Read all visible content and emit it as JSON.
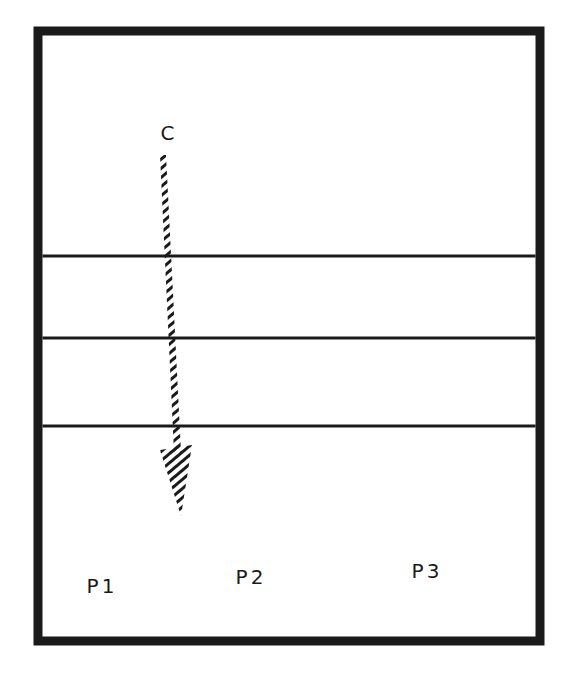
{
  "diagram": {
    "colors": {
      "stroke": "#1a1a1a",
      "background": "#ffffff"
    },
    "frame": {
      "x": 38,
      "y": 31,
      "width": 502,
      "height": 610,
      "stroke_width": 9
    },
    "layers": [
      {
        "y": 256,
        "stroke_width": 3
      },
      {
        "y": 338,
        "stroke_width": 3
      },
      {
        "y": 426,
        "stroke_width": 3
      }
    ],
    "arrow": {
      "label": "C",
      "style": "hatched",
      "direction": "down",
      "start": {
        "x": 163,
        "y": 155
      },
      "head_base": {
        "x": 177,
        "y": 452
      },
      "tip": {
        "x": 181,
        "y": 515
      }
    },
    "labels": [
      {
        "text": "C",
        "x": 169,
        "y": 133
      },
      {
        "text": "P1",
        "x": 102,
        "y": 586
      },
      {
        "text": "P2",
        "x": 251,
        "y": 577
      },
      {
        "text": "P3",
        "x": 427,
        "y": 571
      }
    ]
  }
}
